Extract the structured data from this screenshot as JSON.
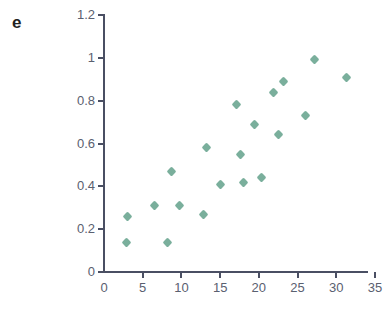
{
  "panel": {
    "label": "e"
  },
  "axes": {
    "x_tick_labels": [
      "0",
      "5",
      "10",
      "15",
      "20",
      "25",
      "30",
      "35"
    ],
    "y_tick_labels": [
      "0",
      "0.2",
      "0.4",
      "0.6",
      "0.8",
      "1",
      "1.2"
    ],
    "axis_color": "#4a4f63",
    "tick_label_color": "#5a6070"
  },
  "marker": {
    "color": "#6fa894",
    "shape": "diamond"
  },
  "chart_data": {
    "type": "scatter",
    "title": "",
    "subtitle": "",
    "annotations": [
      "e"
    ],
    "xlabel": "",
    "ylabel": "",
    "xlim": [
      0,
      35
    ],
    "ylim": [
      0,
      1.2
    ],
    "xticks": [
      0,
      5,
      10,
      15,
      20,
      25,
      30,
      35
    ],
    "yticks": [
      0,
      0.2,
      0.4,
      0.6,
      0.8,
      1,
      1.2
    ],
    "grid": false,
    "legend": null,
    "series": [
      {
        "name": "",
        "marker": "diamond",
        "color": "#6fa894",
        "points": [
          [
            2.9,
            0.14
          ],
          [
            3.0,
            0.26
          ],
          [
            6.5,
            0.31
          ],
          [
            8.2,
            0.14
          ],
          [
            8.7,
            0.47
          ],
          [
            9.7,
            0.31
          ],
          [
            12.8,
            0.27
          ],
          [
            13.2,
            0.58
          ],
          [
            15.1,
            0.41
          ],
          [
            17.1,
            0.78
          ],
          [
            17.6,
            0.55
          ],
          [
            18.0,
            0.42
          ],
          [
            19.4,
            0.69
          ],
          [
            20.4,
            0.44
          ],
          [
            21.9,
            0.84
          ],
          [
            22.6,
            0.64
          ],
          [
            23.2,
            0.89
          ],
          [
            26.0,
            0.73
          ],
          [
            27.2,
            0.99
          ],
          [
            31.3,
            0.91
          ]
        ]
      }
    ]
  }
}
